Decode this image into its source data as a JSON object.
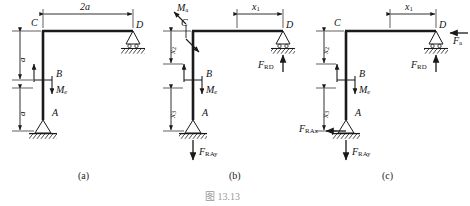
{
  "figure": {
    "caption": "图 13.13",
    "caption_number": "13.13",
    "title_note": "",
    "panels": [
      {
        "key": "a",
        "label": "(a)",
        "description": "L-shaped frame ABCD with pin support at A, roller support at D, applied couple Me at B",
        "joints": [
          "C",
          "D",
          "B",
          "A"
        ],
        "dimensions": [
          {
            "name": "span-top",
            "label": "2a"
          },
          {
            "name": "height-upper",
            "label": "a"
          },
          {
            "name": "height-lower",
            "label": "a"
          }
        ],
        "loads": [
          {
            "name": "couple-me",
            "label": "M",
            "subscript": "e",
            "type": "couple"
          }
        ],
        "supports": [
          {
            "name": "pin-support-a",
            "at": "A",
            "type": "pin"
          },
          {
            "name": "roller-support-d",
            "at": "D",
            "type": "roller"
          }
        ]
      },
      {
        "key": "b",
        "label": "(b)",
        "description": "Free body diagram with applied couple Ma at C, reaction FRD at D and FRAy at A",
        "joints": [
          "C",
          "D",
          "B",
          "A"
        ],
        "dimensions": [
          {
            "name": "dim-x1",
            "label": "x",
            "subscript": "1"
          },
          {
            "name": "dim-x2",
            "label": "x",
            "subscript": "2"
          },
          {
            "name": "dim-x3",
            "label": "x",
            "subscript": "3"
          }
        ],
        "loads": [
          {
            "name": "couple-ma",
            "label": "M",
            "subscript": "a",
            "type": "couple"
          },
          {
            "name": "couple-me",
            "label": "M",
            "subscript": "e",
            "type": "couple"
          },
          {
            "name": "force-frd",
            "label": "F",
            "subscript": "RD",
            "type": "force",
            "direction": "up"
          },
          {
            "name": "force-fray",
            "label": "F",
            "subscript": "RAy",
            "type": "force",
            "direction": "down"
          }
        ],
        "supports": [
          {
            "name": "pin-support-a",
            "at": "A",
            "type": "pin"
          },
          {
            "name": "roller-support-d",
            "at": "D",
            "type": "roller"
          }
        ]
      },
      {
        "key": "c",
        "label": "(c)",
        "description": "Free body diagram with horizontal force Fa at D, reactions FRD, FRAx and FRAy",
        "joints": [
          "C",
          "D",
          "B",
          "A"
        ],
        "dimensions": [
          {
            "name": "dim-x1",
            "label": "x",
            "subscript": "1"
          },
          {
            "name": "dim-x2",
            "label": "x",
            "subscript": "2"
          },
          {
            "name": "dim-x3",
            "label": "x",
            "subscript": "3"
          }
        ],
        "loads": [
          {
            "name": "force-fa",
            "label": "F",
            "subscript": "a",
            "type": "force",
            "direction": "left"
          },
          {
            "name": "couple-me",
            "label": "M",
            "subscript": "e",
            "type": "couple"
          },
          {
            "name": "force-frd",
            "label": "F",
            "subscript": "RD",
            "type": "force",
            "direction": "up"
          },
          {
            "name": "force-frax",
            "label": "F",
            "subscript": "RAx",
            "type": "force",
            "direction": "left"
          },
          {
            "name": "force-fray",
            "label": "F",
            "subscript": "RAy",
            "type": "force",
            "direction": "down"
          }
        ],
        "supports": [
          {
            "name": "pin-support-a",
            "at": "A",
            "type": "pin"
          },
          {
            "name": "roller-support-d",
            "at": "D",
            "type": "roller"
          }
        ]
      }
    ],
    "text": {
      "joint_a": "A",
      "joint_b": "B",
      "joint_c": "C",
      "joint_d": "D",
      "dim_2a": "2a",
      "dim_a": "a",
      "var_x": "x",
      "sub_1": "1",
      "sub_2": "2",
      "sub_3": "3",
      "force_f": "F",
      "moment_m": "M",
      "sub_e": "e",
      "sub_a": "a",
      "sub_RD": "RD",
      "sub_RAy": "RAy",
      "sub_RAx": "RAx",
      "panel_a": "(a)",
      "panel_b": "(b)",
      "panel_c": "(c)"
    },
    "colors": {
      "line": "#1a1a1a",
      "caption": "#9a9a9a",
      "background": "#ffffff"
    }
  }
}
